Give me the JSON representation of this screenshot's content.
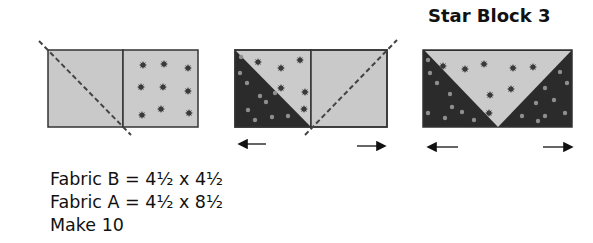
{
  "title": "Star Block 3",
  "colors": {
    "light_fabric": "#c9c9c9",
    "dark_fabric": "#2b2b2b",
    "outline": "#333333",
    "star_on_light": "#3a3a3a",
    "dot_on_dark": "#8f8f8f",
    "cut_line": "#444444"
  },
  "steps": [
    {
      "name": "step-1",
      "description": "Fabric B square on left, Fabric A (star print) square on right, dashed diagonal cut line across left square"
    },
    {
      "name": "step-2",
      "description": "Left square sewn and pressed showing dark star triangle; dashed diagonal on right square; press arrows left and right"
    },
    {
      "name": "step-3",
      "description": "Finished flying-geese unit: light star triangle center with dark corners; press arrows left and right"
    }
  ],
  "instructions": [
    "Fabric B = 4½ x 4½",
    "Fabric A = 4½ x 8½",
    "Make 10"
  ]
}
